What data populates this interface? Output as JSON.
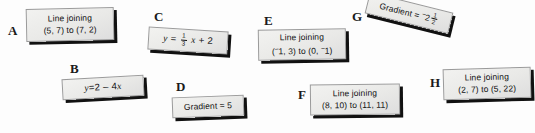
{
  "worksheet": {
    "background_color": "#fdfdfd",
    "card_face_color": "#ecebe9",
    "card_border_color": "#9a9a9a",
    "card_shadow_color": "#111111",
    "text_color": "#111111"
  },
  "cards": [
    {
      "letter": "A",
      "type": "line-joining",
      "line1": "Line joining",
      "line2": "(5, 7) to (7, 2)"
    },
    {
      "letter": "B",
      "type": "equation",
      "lhs": "y",
      "equals": "=",
      "rhs": "2 – 4",
      "rhs_var": "x"
    },
    {
      "letter": "C",
      "type": "equation-fraction",
      "lhs": "y",
      "equals": "=",
      "frac_num": "1",
      "frac_den": "3",
      "var": "x",
      "tail": "+ 2"
    },
    {
      "letter": "D",
      "type": "gradient",
      "text": "Gradient = 5"
    },
    {
      "letter": "E",
      "type": "line-joining",
      "line1": "Line joining",
      "neg1": "−",
      "part1": "1, 3) to (0, ",
      "neg2": "−",
      "part2": "1)",
      "open_paren": "("
    },
    {
      "letter": "F",
      "type": "line-joining",
      "line1": "Line joining",
      "line2": "(8, 10) to (11, 11)"
    },
    {
      "letter": "G",
      "type": "gradient-fraction",
      "label": "Gradient = ",
      "neg": "−",
      "whole": "2",
      "frac_num": "1",
      "frac_den": "2"
    },
    {
      "letter": "H",
      "type": "line-joining",
      "line1": "Line joining",
      "line2": "(2, 7) to (5, 22)"
    }
  ]
}
